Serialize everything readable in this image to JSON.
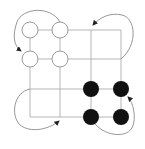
{
  "diagram": {
    "type": "grid-rotation",
    "grid": {
      "rows": 4,
      "cols": 4,
      "x": [
        30,
        60,
        91,
        121
      ],
      "y": [
        30,
        59,
        89,
        117
      ],
      "line_color": "#b5b5b5"
    },
    "white_pieces": [
      [
        30,
        30
      ],
      [
        60,
        30
      ],
      [
        30,
        59
      ],
      [
        60,
        59
      ]
    ],
    "black_pieces": [
      [
        91,
        89
      ],
      [
        121,
        89
      ],
      [
        91,
        117
      ],
      [
        121,
        117
      ]
    ],
    "piece_radius": 8,
    "colors": {
      "white_fill": "#ffffff",
      "black_fill": "#111111",
      "outline": "#9a9a9a",
      "arrow": "#8a8a8a",
      "arrowhead": "#222222"
    },
    "arrows": [
      {
        "name": "top-left-rotation"
      },
      {
        "name": "top-right-rotation"
      },
      {
        "name": "bottom-left-rotation"
      },
      {
        "name": "bottom-right-rotation"
      }
    ]
  }
}
